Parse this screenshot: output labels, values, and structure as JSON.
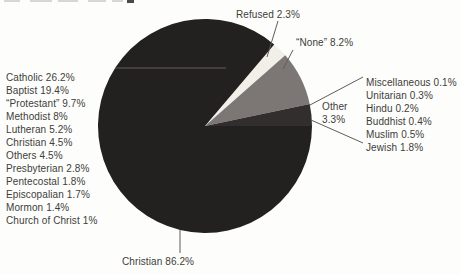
{
  "chart_data": {
    "type": "pie",
    "title": "",
    "unit": "%",
    "start_angle_deg": 40.3,
    "direction": "clockwise",
    "legend_position": "callout-labels",
    "slices": [
      {
        "label": "Refused",
        "value": 2.3,
        "display": "Refused 2.3%",
        "color": "#f1efe7"
      },
      {
        "label": "None",
        "value": 8.2,
        "display": "“None” 8.2%",
        "color": "#7c7774"
      },
      {
        "label": "Other",
        "value": 3.3,
        "display_line1": "Other",
        "display_line2": "3.3%",
        "color": "#312e2d"
      },
      {
        "label": "Christian",
        "value": 86.2,
        "display": "Christian 86.2%",
        "color": "#232020"
      }
    ],
    "christian_breakdown": [
      {
        "label": "Catholic",
        "value": 26.2,
        "text": "Catholic 26.2%"
      },
      {
        "label": "Baptist",
        "value": 19.4,
        "text": "Baptist 19.4%"
      },
      {
        "label": "Protestant",
        "value": 9.7,
        "text": "“Protestant” 9.7%"
      },
      {
        "label": "Methodist",
        "value": 8,
        "text": "Methodist 8%"
      },
      {
        "label": "Lutheran",
        "value": 5.2,
        "text": "Lutheran 5.2%"
      },
      {
        "label": "Christian",
        "value": 4.5,
        "text": "Christian 4.5%"
      },
      {
        "label": "Others",
        "value": 4.5,
        "text": "Others 4.5%"
      },
      {
        "label": "Presbyterian",
        "value": 2.8,
        "text": "Presbyterian 2.8%"
      },
      {
        "label": "Pentecostal",
        "value": 1.8,
        "text": "Pentecostal 1.8%"
      },
      {
        "label": "Episcopalian",
        "value": 1.7,
        "text": "Episcopalian 1.7%"
      },
      {
        "label": "Mormon",
        "value": 1.4,
        "text": "Mormon 1.4%"
      },
      {
        "label": "Church of Christ",
        "value": 1,
        "text": "Church of Christ 1%"
      }
    ],
    "other_breakdown": [
      {
        "label": "Miscellaneous",
        "value": 0.1,
        "text": "Miscellaneous 0.1%"
      },
      {
        "label": "Unitarian",
        "value": 0.3,
        "text": "Unitarian 0.3%"
      },
      {
        "label": "Hindu",
        "value": 0.2,
        "text": "Hindu 0.2%"
      },
      {
        "label": "Buddhist",
        "value": 0.4,
        "text": "Buddhist 0.4%"
      },
      {
        "label": "Muslim",
        "value": 0.5,
        "text": "Muslim 0.5%"
      },
      {
        "label": "Jewish",
        "value": 1.8,
        "text": "Jewish 1.8%"
      }
    ],
    "colors": {
      "text": "#403d3a",
      "leader_line": "#605c59",
      "background": "#fdfdfc"
    }
  }
}
